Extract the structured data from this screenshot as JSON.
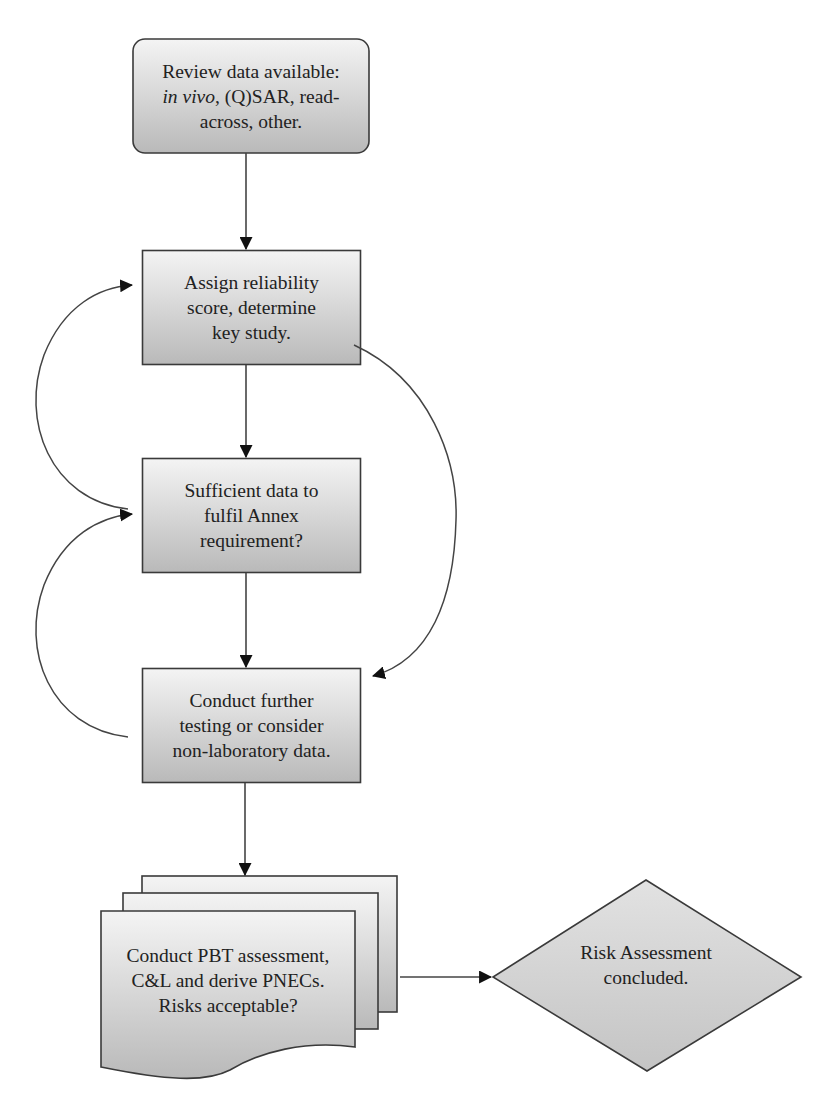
{
  "diagram": {
    "type": "flowchart",
    "nodes": [
      {
        "id": "review",
        "shape": "rounded-rect",
        "lines": [
          "Review data available:",
          "in vivo|, (Q)SAR, read-",
          "across, other."
        ],
        "line1": "Review data available:",
        "line2_italic": "in vivo",
        "line2_rest": ", (Q)SAR, read-",
        "line3": "across, other."
      },
      {
        "id": "assign",
        "shape": "rect",
        "line1": "Assign reliability",
        "line2": "score, determine",
        "line3": "key study."
      },
      {
        "id": "sufficient",
        "shape": "rect",
        "line1": "Sufficient data to",
        "line2": "fulfil Annex",
        "line3": "requirement?"
      },
      {
        "id": "conduct_testing",
        "shape": "rect",
        "line1": "Conduct further",
        "line2": "testing or consider",
        "line3": "non-laboratory data."
      },
      {
        "id": "pbt",
        "shape": "multi-document",
        "line1": "Conduct PBT assessment,",
        "line2": "C&L and derive PNECs.",
        "line3": "Risks acceptable?"
      },
      {
        "id": "concluded",
        "shape": "diamond",
        "line1": "Risk Assessment",
        "line2": "concluded."
      }
    ],
    "edges": [
      {
        "from": "review",
        "to": "assign",
        "style": "straight"
      },
      {
        "from": "assign",
        "to": "sufficient",
        "style": "straight"
      },
      {
        "from": "sufficient",
        "to": "assign",
        "style": "curved-left"
      },
      {
        "from": "assign",
        "to": "conduct_testing",
        "style": "curved-right"
      },
      {
        "from": "sufficient",
        "to": "conduct_testing",
        "style": "straight"
      },
      {
        "from": "conduct_testing",
        "to": "sufficient",
        "style": "curved-left"
      },
      {
        "from": "conduct_testing",
        "to": "pbt",
        "style": "straight"
      },
      {
        "from": "pbt",
        "to": "concluded",
        "style": "straight"
      }
    ],
    "colors": {
      "fill_light": "#f2f2f2",
      "fill_dark": "#bdbdbd",
      "stroke": "#3a3a3a",
      "arrow": "#111111"
    }
  }
}
